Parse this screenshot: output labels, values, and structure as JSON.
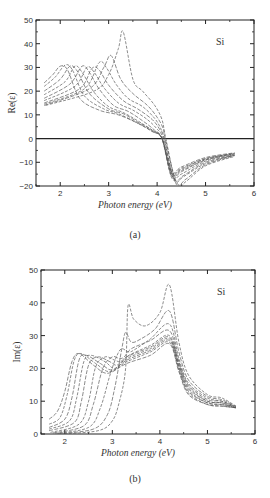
{
  "chart_data": [
    {
      "panel": "(a)",
      "type": "line",
      "title": "",
      "annotation": "Si",
      "xlabel": "Photon energy (eV)",
      "ylabel": "Re(ε)",
      "xlim": [
        1.5,
        6
      ],
      "ylim": [
        -20,
        50
      ],
      "xticks": [
        2,
        3,
        4,
        5,
        6
      ],
      "yticks": [
        -20,
        -10,
        0,
        10,
        20,
        30,
        40,
        50
      ],
      "grid": false,
      "zero_line": true,
      "line_style": "dashed, gray",
      "series": [
        {
          "name": "curve-1",
          "x": [
            1.67,
            1.85,
            2.0,
            2.15,
            2.4,
            2.8,
            3.2,
            3.6,
            3.9,
            4.1,
            4.3,
            4.5,
            5.0,
            5.6
          ],
          "y": [
            23.5,
            27,
            30.5,
            29,
            17,
            12,
            10,
            6.5,
            3,
            0,
            -14,
            -12,
            -8,
            -6
          ]
        },
        {
          "name": "curve-2",
          "x": [
            1.67,
            1.9,
            2.1,
            2.25,
            2.5,
            2.9,
            3.2,
            3.6,
            3.9,
            4.1,
            4.3,
            4.5,
            5.0,
            5.6
          ],
          "y": [
            22,
            26,
            31,
            29,
            18,
            12.5,
            10.5,
            6.5,
            3,
            0,
            -14.5,
            -12.5,
            -8.5,
            -6.2
          ]
        },
        {
          "name": "curve-3",
          "x": [
            1.67,
            2.0,
            2.2,
            2.35,
            2.6,
            3.0,
            3.3,
            3.6,
            3.9,
            4.1,
            4.3,
            4.5,
            5.0,
            5.6
          ],
          "y": [
            20,
            25,
            30.5,
            28.5,
            19,
            12.5,
            10.5,
            7,
            3.5,
            0,
            -15,
            -13,
            -8.5,
            -6.3
          ]
        },
        {
          "name": "curve-4",
          "x": [
            1.67,
            2.1,
            2.3,
            2.45,
            2.7,
            3.0,
            3.3,
            3.6,
            3.9,
            4.1,
            4.3,
            4.5,
            5.0,
            5.6
          ],
          "y": [
            18.5,
            24,
            30.5,
            28,
            19.5,
            13.5,
            11,
            7.5,
            3.5,
            0,
            -15.5,
            -13.5,
            -9,
            -6.5
          ]
        },
        {
          "name": "curve-5",
          "x": [
            1.67,
            2.2,
            2.45,
            2.6,
            2.8,
            3.1,
            3.4,
            3.7,
            3.95,
            4.1,
            4.3,
            4.5,
            5.0,
            5.6
          ],
          "y": [
            17,
            23,
            30.5,
            28,
            21,
            14,
            11.5,
            7.5,
            3.5,
            0,
            -16,
            -14,
            -9,
            -6.5
          ]
        },
        {
          "name": "curve-6",
          "x": [
            1.67,
            2.3,
            2.55,
            2.7,
            2.9,
            3.2,
            3.5,
            3.8,
            4.0,
            4.12,
            4.3,
            4.5,
            5.0,
            5.6
          ],
          "y": [
            16,
            22,
            30,
            28,
            21.5,
            15,
            12,
            8,
            4,
            0,
            -16.5,
            -15,
            -9.5,
            -6.8
          ]
        },
        {
          "name": "curve-7",
          "x": [
            1.67,
            2.4,
            2.65,
            2.8,
            3.0,
            3.3,
            3.6,
            3.9,
            4.05,
            4.14,
            4.35,
            4.55,
            5.0,
            5.6
          ],
          "y": [
            15,
            21,
            29.5,
            29,
            22.5,
            16,
            12.5,
            8,
            4,
            0,
            -17,
            -15.5,
            -10,
            -7
          ]
        },
        {
          "name": "curve-8",
          "x": [
            1.67,
            2.5,
            2.8,
            2.95,
            3.15,
            3.4,
            3.7,
            3.95,
            4.08,
            4.15,
            4.35,
            4.55,
            5.0,
            5.6
          ],
          "y": [
            14.5,
            21,
            32,
            30,
            23,
            17,
            13.5,
            8.5,
            4,
            0,
            -17.5,
            -16,
            -10.5,
            -7
          ]
        },
        {
          "name": "curve-9",
          "x": [
            1.67,
            2.6,
            2.9,
            3.05,
            3.25,
            3.5,
            3.8,
            4.0,
            4.12,
            4.17,
            4.4,
            4.6,
            5.0,
            5.6
          ],
          "y": [
            14,
            21,
            30,
            35,
            25,
            19,
            14,
            9,
            4.5,
            0,
            -18.5,
            -17,
            -11,
            -7.2
          ]
        },
        {
          "name": "curve-10",
          "x": [
            1.7,
            2.7,
            3.0,
            3.2,
            3.3,
            3.5,
            3.7,
            3.95,
            4.1,
            4.18,
            4.4,
            4.6,
            5.0,
            5.6
          ],
          "y": [
            14,
            20,
            27,
            38,
            45,
            25,
            20,
            14,
            8,
            0,
            -19.5,
            -18,
            -11.5,
            -7.5
          ]
        }
      ]
    },
    {
      "panel": "(b)",
      "type": "line",
      "title": "",
      "annotation": "Si",
      "xlabel": "Photon energy (eV)",
      "ylabel": "Im(ε)",
      "xlim": [
        1.5,
        6
      ],
      "ylim": [
        0,
        50
      ],
      "xticks": [
        2,
        3,
        4,
        5,
        6
      ],
      "yticks": [
        0,
        10,
        20,
        30,
        40,
        50
      ],
      "grid": false,
      "line_style": "dashed, gray",
      "series": [
        {
          "name": "curve-1",
          "x": [
            1.67,
            1.85,
            2.0,
            2.15,
            2.3,
            2.6,
            2.9,
            3.3,
            3.8,
            4.2,
            4.4,
            4.6,
            5.0,
            5.3,
            5.6
          ],
          "y": [
            4.5,
            7,
            13,
            22,
            24.5,
            21,
            18.5,
            21.5,
            24,
            27.5,
            19,
            12,
            9,
            8.5,
            8
          ]
        },
        {
          "name": "curve-2",
          "x": [
            1.67,
            1.9,
            2.05,
            2.2,
            2.35,
            2.65,
            2.95,
            3.3,
            3.8,
            4.2,
            4.4,
            4.6,
            5.0,
            5.3,
            5.6
          ],
          "y": [
            3,
            5,
            12,
            22.5,
            24.5,
            21.5,
            19,
            22,
            25,
            28,
            19.5,
            12.5,
            9,
            8.5,
            8
          ]
        },
        {
          "name": "curve-3",
          "x": [
            1.67,
            2.0,
            2.15,
            2.3,
            2.45,
            2.75,
            3.0,
            3.3,
            3.8,
            4.2,
            4.4,
            4.6,
            5.0,
            5.3,
            5.6
          ],
          "y": [
            2,
            4.5,
            11,
            22.5,
            24,
            21.5,
            19.5,
            22.5,
            25.5,
            28.5,
            20,
            13,
            9.5,
            9,
            8
          ]
        },
        {
          "name": "curve-4",
          "x": [
            1.67,
            2.1,
            2.25,
            2.4,
            2.55,
            2.85,
            3.05,
            3.3,
            3.8,
            4.2,
            4.4,
            4.6,
            5.0,
            5.3,
            5.6
          ],
          "y": [
            1.5,
            4,
            11,
            22,
            24,
            22,
            20,
            23,
            26,
            29,
            20.5,
            13.5,
            9.5,
            9,
            8
          ]
        },
        {
          "name": "curve-5",
          "x": [
            1.67,
            2.2,
            2.35,
            2.5,
            2.7,
            2.95,
            3.1,
            3.3,
            3.8,
            4.2,
            4.4,
            4.6,
            5.0,
            5.3,
            5.6
          ],
          "y": [
            1,
            3.5,
            10,
            21,
            23.5,
            22,
            21,
            23.5,
            26.5,
            29.5,
            21,
            14,
            10,
            9.5,
            8
          ]
        },
        {
          "name": "curve-6",
          "x": [
            1.7,
            2.3,
            2.5,
            2.65,
            2.85,
            3.05,
            3.2,
            3.35,
            3.8,
            4.2,
            4.4,
            4.6,
            5.0,
            5.3,
            5.6
          ],
          "y": [
            0.5,
            3,
            10,
            20.5,
            23.5,
            22.5,
            22,
            24,
            27,
            30,
            21.5,
            14.5,
            10,
            9.5,
            8
          ]
        },
        {
          "name": "curve-7",
          "x": [
            1.75,
            2.4,
            2.6,
            2.8,
            3.0,
            3.15,
            3.25,
            3.4,
            3.8,
            4.2,
            4.4,
            4.6,
            5.0,
            5.3,
            5.6
          ],
          "y": [
            0.3,
            2.5,
            9,
            20,
            23.5,
            23,
            23.5,
            26,
            28.5,
            31.5,
            22,
            15,
            10.5,
            10,
            8.2
          ]
        },
        {
          "name": "curve-8",
          "x": [
            1.8,
            2.5,
            2.75,
            2.95,
            3.1,
            3.2,
            3.35,
            3.5,
            3.8,
            4.2,
            4.4,
            4.6,
            5.0,
            5.3,
            5.6
          ],
          "y": [
            0.2,
            2,
            8,
            18,
            24,
            26,
            25,
            26,
            29,
            33.5,
            23,
            15.5,
            11,
            10,
            8.3
          ]
        },
        {
          "name": "curve-9",
          "x": [
            1.85,
            2.6,
            2.9,
            3.05,
            3.2,
            3.28,
            3.4,
            3.6,
            3.9,
            4.2,
            4.4,
            4.6,
            5.0,
            5.3,
            5.6
          ],
          "y": [
            0.1,
            1.5,
            6,
            14,
            26,
            31,
            28,
            29,
            32,
            37.5,
            25,
            16.5,
            11.5,
            10.5,
            8.4
          ]
        },
        {
          "name": "curve-10",
          "x": [
            1.9,
            2.7,
            3.0,
            3.15,
            3.28,
            3.33,
            3.45,
            3.7,
            4.0,
            4.2,
            4.4,
            4.6,
            5.0,
            5.3,
            5.6
          ],
          "y": [
            0,
            1,
            4,
            10,
            20,
            39,
            35,
            33,
            37,
            45.5,
            28,
            18,
            12,
            11,
            8.5
          ]
        }
      ]
    }
  ],
  "panels": {
    "a": {
      "caption": "(a)",
      "material": "Si",
      "ylabel": "Re(ε)",
      "xlabel": "Photon energy (eV)"
    },
    "b": {
      "caption": "(b)",
      "material": "Si",
      "ylabel": "Im(ε)",
      "xlabel": "Photon energy (eV)"
    }
  },
  "colors": {
    "curves": "#555555",
    "axes": "#222222",
    "text": "#333333"
  }
}
